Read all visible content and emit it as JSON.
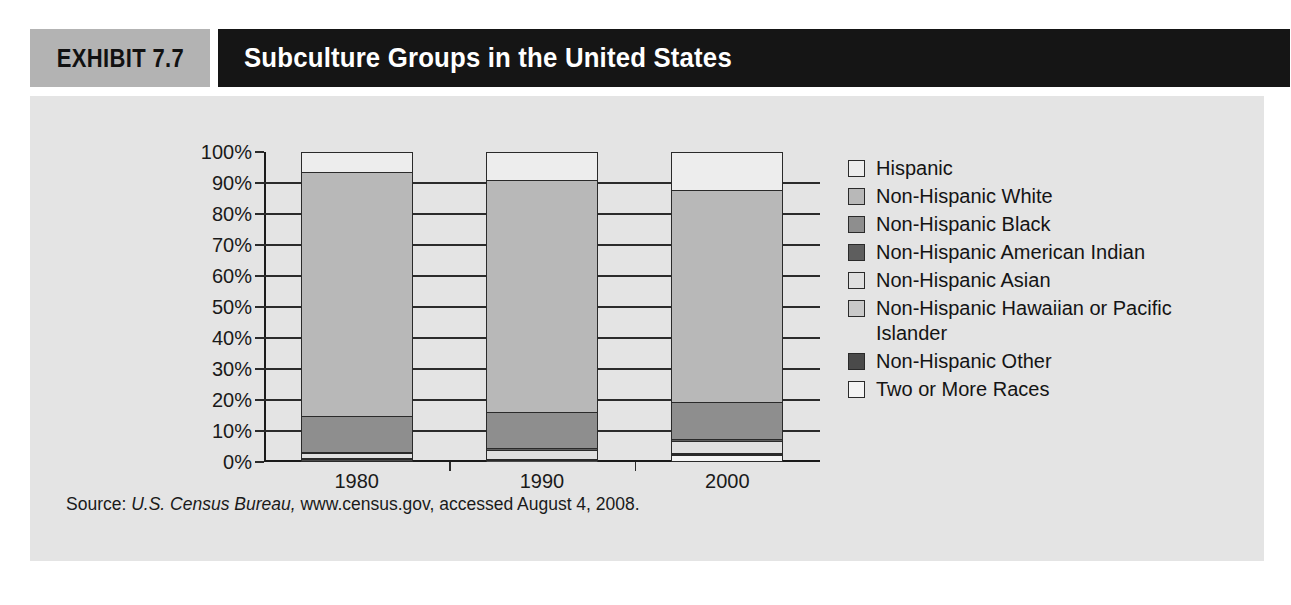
{
  "header": {
    "exhibit_label": "EXHIBIT 7.7",
    "title": "Subculture Groups in the United States"
  },
  "source": {
    "prefix": "Source: ",
    "italic": "U.S. Census Bureau,",
    "rest": " www.census.gov, accessed August 4, 2008."
  },
  "legend": {
    "items": [
      {
        "label": "Hispanic",
        "color": "#ededed"
      },
      {
        "label": "Non-Hispanic White",
        "color": "#b8b8b8"
      },
      {
        "label": "Non-Hispanic Black",
        "color": "#8e8e8e"
      },
      {
        "label": "Non-Hispanic American Indian",
        "color": "#5e5e5e"
      },
      {
        "label": "Non-Hispanic Asian",
        "color": "#e0e0e0"
      },
      {
        "label": "Non-Hispanic Hawaiian or Pacific Islander",
        "color": "#c9c9c9"
      },
      {
        "label": "Non-Hispanic Other",
        "color": "#4a4a4a"
      },
      {
        "label": "Two or More Races",
        "color": "#f4f4f4"
      }
    ]
  },
  "axis": {
    "y_ticks": [
      "100%",
      "90%",
      "80%",
      "70%",
      "60%",
      "50%",
      "40%",
      "30%",
      "20%",
      "10%",
      "0%"
    ],
    "x_ticks": [
      "1980",
      "1990",
      "2000"
    ]
  },
  "chart_data": {
    "type": "bar",
    "subtype": "stacked-100-percent",
    "title": "Subculture Groups in the United States",
    "xlabel": "",
    "ylabel": "",
    "ylim": [
      0,
      100
    ],
    "grid": true,
    "legend_position": "right",
    "categories": [
      "1980",
      "1990",
      "2000"
    ],
    "stack_order_bottom_to_top": [
      "Two or More Races",
      "Non-Hispanic Other",
      "Non-Hispanic Hawaiian or Pacific Islander",
      "Non-Hispanic Asian",
      "Non-Hispanic American Indian",
      "Non-Hispanic Black",
      "Non-Hispanic White",
      "Hispanic"
    ],
    "series": [
      {
        "name": "Hispanic",
        "color": "#ededed",
        "values": [
          6.5,
          9.0,
          12.5
        ]
      },
      {
        "name": "Non-Hispanic White",
        "color": "#b8b8b8",
        "values": [
          79.5,
          75.5,
          69.0
        ]
      },
      {
        "name": "Non-Hispanic Black",
        "color": "#8e8e8e",
        "values": [
          11.5,
          11.8,
          12.1
        ]
      },
      {
        "name": "Non-Hispanic American Indian",
        "color": "#5e5e5e",
        "values": [
          0.6,
          0.7,
          0.7
        ]
      },
      {
        "name": "Non-Hispanic Asian",
        "color": "#e0e0e0",
        "values": [
          1.5,
          2.8,
          3.6
        ]
      },
      {
        "name": "Non-Hispanic Hawaiian or Pacific Islander",
        "color": "#c9c9c9",
        "values": [
          0.1,
          0.1,
          0.1
        ]
      },
      {
        "name": "Non-Hispanic Other",
        "color": "#4a4a4a",
        "values": [
          0.3,
          0.1,
          0.2
        ]
      },
      {
        "name": "Two or More Races",
        "color": "#f4f4f4",
        "values": [
          0.0,
          0.0,
          1.8
        ]
      }
    ],
    "bars": [
      {
        "category": "1980",
        "total": 100,
        "segments_top_to_bottom": [
          {
            "name": "Hispanic",
            "value": 6.5,
            "color": "#ededed"
          },
          {
            "name": "Non-Hispanic White",
            "value": 79.5,
            "color": "#b8b8b8"
          },
          {
            "name": "Non-Hispanic Black",
            "value": 11.5,
            "color": "#8e8e8e"
          },
          {
            "name": "Non-Hispanic American Indian",
            "value": 0.6,
            "color": "#5e5e5e"
          },
          {
            "name": "Non-Hispanic Asian",
            "value": 1.5,
            "color": "#e0e0e0"
          },
          {
            "name": "Non-Hispanic Hawaiian or Pacific Islander",
            "value": 0.1,
            "color": "#c9c9c9"
          },
          {
            "name": "Non-Hispanic Other",
            "value": 0.3,
            "color": "#4a4a4a"
          },
          {
            "name": "Two or More Races",
            "value": 0.0,
            "color": "#f4f4f4"
          }
        ]
      },
      {
        "category": "1990",
        "total": 100,
        "segments_top_to_bottom": [
          {
            "name": "Hispanic",
            "value": 9.0,
            "color": "#ededed"
          },
          {
            "name": "Non-Hispanic White",
            "value": 75.5,
            "color": "#b8b8b8"
          },
          {
            "name": "Non-Hispanic Black",
            "value": 11.8,
            "color": "#8e8e8e"
          },
          {
            "name": "Non-Hispanic American Indian",
            "value": 0.7,
            "color": "#5e5e5e"
          },
          {
            "name": "Non-Hispanic Asian",
            "value": 2.8,
            "color": "#e0e0e0"
          },
          {
            "name": "Non-Hispanic Hawaiian or Pacific Islander",
            "value": 0.1,
            "color": "#c9c9c9"
          },
          {
            "name": "Non-Hispanic Other",
            "value": 0.1,
            "color": "#4a4a4a"
          },
          {
            "name": "Two or More Races",
            "value": 0.0,
            "color": "#f4f4f4"
          }
        ]
      },
      {
        "category": "2000",
        "total": 100,
        "segments_top_to_bottom": [
          {
            "name": "Hispanic",
            "value": 12.5,
            "color": "#ededed"
          },
          {
            "name": "Non-Hispanic White",
            "value": 69.0,
            "color": "#b8b8b8"
          },
          {
            "name": "Non-Hispanic Black",
            "value": 12.1,
            "color": "#8e8e8e"
          },
          {
            "name": "Non-Hispanic American Indian",
            "value": 0.7,
            "color": "#5e5e5e"
          },
          {
            "name": "Non-Hispanic Asian",
            "value": 3.6,
            "color": "#e0e0e0"
          },
          {
            "name": "Non-Hispanic Hawaiian or Pacific Islander",
            "value": 0.1,
            "color": "#c9c9c9"
          },
          {
            "name": "Non-Hispanic Other",
            "value": 0.2,
            "color": "#4a4a4a"
          },
          {
            "name": "Two or More Races",
            "value": 1.8,
            "color": "#f4f4f4"
          }
        ]
      }
    ]
  }
}
